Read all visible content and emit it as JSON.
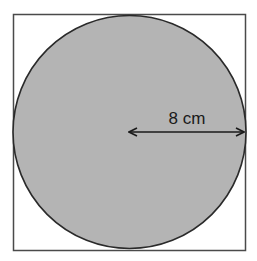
{
  "diagram": {
    "type": "circle inscribed in square",
    "square": {
      "x": 13,
      "y": 14,
      "size": 233,
      "stroke": "#4a4a4a"
    },
    "circle": {
      "cx": 129.5,
      "cy": 131.5,
      "r": 116.5,
      "fill": "#b4b4b4",
      "stroke": "#2a2a2a"
    },
    "radius_arrow": {
      "x1": 129,
      "x2": 245,
      "y": 132,
      "color": "#1a1a1a"
    },
    "radius_label": "8 cm"
  }
}
